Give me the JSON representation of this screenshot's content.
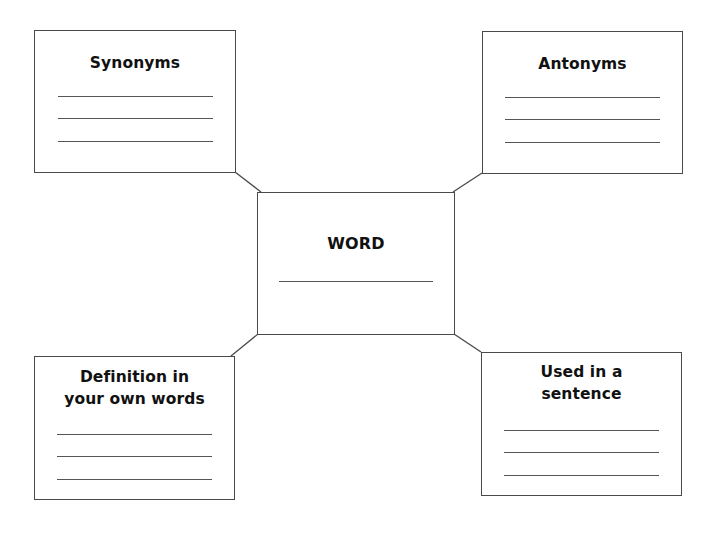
{
  "diagram": {
    "type": "vocabulary-word-map",
    "center": {
      "title": "WORD",
      "blank_lines": 1
    },
    "branches": [
      {
        "position": "top-left",
        "title_lines": [
          "Synonyms"
        ],
        "blank_lines": 3
      },
      {
        "position": "top-right",
        "title_lines": [
          "Antonyms"
        ],
        "blank_lines": 3
      },
      {
        "position": "bottom-left",
        "title_lines": [
          "Definition in",
          "your own words"
        ],
        "blank_lines": 3
      },
      {
        "position": "bottom-right",
        "title_lines": [
          "Used in a",
          "sentence"
        ],
        "blank_lines": 3
      }
    ],
    "colors": {
      "border": "#4a4a4a",
      "rule": "#555555",
      "text": "#111111",
      "background": "#ffffff"
    }
  }
}
